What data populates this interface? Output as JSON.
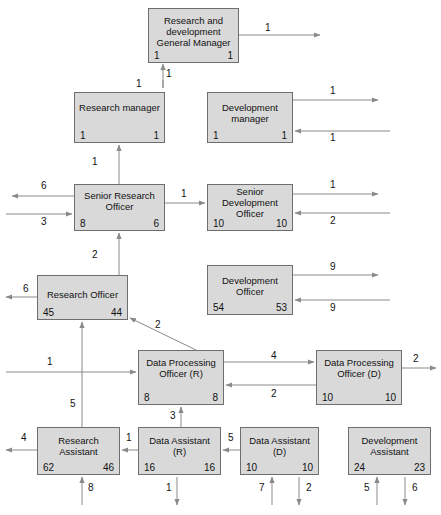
{
  "diagram": {
    "type": "organization-flow-diagram",
    "node_fill": "#d9d9d9",
    "node_stroke": "#6e6e6e",
    "line_color": "#8a8a8a",
    "nodes": [
      {
        "id": "gm",
        "title": "Research and development General Manager",
        "left_count": "1",
        "right_count": "1",
        "x": 148,
        "y": 8,
        "w": 91,
        "h": 55
      },
      {
        "id": "rm",
        "title": "Research manager",
        "left_count": "1",
        "right_count": "1",
        "x": 74,
        "y": 92,
        "w": 91,
        "h": 51
      },
      {
        "id": "dm",
        "title": "Development manager",
        "left_count": "1",
        "right_count": "1",
        "x": 207,
        "y": 92,
        "w": 86,
        "h": 51
      },
      {
        "id": "sro",
        "title": "Senior Research Officer",
        "left_count": "8",
        "right_count": "6",
        "x": 74,
        "y": 184,
        "w": 91,
        "h": 47
      },
      {
        "id": "sdo",
        "title": "Senior Development Officer",
        "left_count": "10",
        "right_count": "10",
        "x": 207,
        "y": 184,
        "w": 86,
        "h": 47
      },
      {
        "id": "ro",
        "title": "Research Officer",
        "left_count": "45",
        "right_count": "44",
        "x": 37,
        "y": 275,
        "w": 91,
        "h": 45
      },
      {
        "id": "do",
        "title": "Development Officer",
        "left_count": "54",
        "right_count": "53",
        "x": 207,
        "y": 265,
        "w": 86,
        "h": 50
      },
      {
        "id": "dpor",
        "title": "Data Processing Officer (R)",
        "left_count": "8",
        "right_count": "8",
        "x": 138,
        "y": 350,
        "w": 86,
        "h": 55
      },
      {
        "id": "dpod",
        "title": "Data Processing Officer (D)",
        "left_count": "10",
        "right_count": "10",
        "x": 316,
        "y": 350,
        "w": 86,
        "h": 55
      },
      {
        "id": "ra",
        "title": "Research Assistant",
        "left_count": "62",
        "right_count": "46",
        "x": 37,
        "y": 427,
        "w": 83,
        "h": 48
      },
      {
        "id": "dar",
        "title": "Data Assistant (R)",
        "left_count": "16",
        "right_count": "16",
        "x": 138,
        "y": 427,
        "w": 83,
        "h": 48
      },
      {
        "id": "dad",
        "title": "Data Assistant (D)",
        "left_count": "10",
        "right_count": "10",
        "x": 240,
        "y": 427,
        "w": 79,
        "h": 48
      },
      {
        "id": "da",
        "title": "Development Assistant",
        "left_count": "24",
        "right_count": "23",
        "x": 348,
        "y": 427,
        "w": 83,
        "h": 48
      }
    ],
    "edge_labels": [
      {
        "id": "gm-out",
        "text": "1",
        "x": 265,
        "y": 22
      },
      {
        "id": "gm-in-bottom",
        "text": "1",
        "x": 166,
        "y": 68
      },
      {
        "id": "rm-up",
        "text": "1",
        "x": 136,
        "y": 78
      },
      {
        "id": "dm-out",
        "text": "1",
        "x": 330,
        "y": 93
      },
      {
        "id": "dm-in",
        "text": "1",
        "x": 330,
        "y": 128
      },
      {
        "id": "sro-up",
        "text": "1",
        "x": 92,
        "y": 158
      },
      {
        "id": "sro-out-left",
        "text": "6",
        "x": 41,
        "y": 182
      },
      {
        "id": "sro-in-left",
        "text": "3",
        "x": 41,
        "y": 217
      },
      {
        "id": "sro-to-sdo",
        "text": "1",
        "x": 181,
        "y": 189
      },
      {
        "id": "sdo-out-right",
        "text": "1",
        "x": 330,
        "y": 182
      },
      {
        "id": "sdo-in-right",
        "text": "2",
        "x": 330,
        "y": 217
      },
      {
        "id": "ro-up",
        "text": "2",
        "x": 92,
        "y": 251
      },
      {
        "id": "ro-out-left",
        "text": "6",
        "x": 23,
        "y": 285
      },
      {
        "id": "do-out-right",
        "text": "9",
        "x": 330,
        "y": 266
      },
      {
        "id": "do-in-right",
        "text": "9",
        "x": 330,
        "y": 303
      },
      {
        "id": "dpor-diag",
        "text": "2",
        "x": 155,
        "y": 321
      },
      {
        "id": "dpor-in-left",
        "text": "1",
        "x": 47,
        "y": 358
      },
      {
        "id": "dpor-to-dpod",
        "text": "4",
        "x": 271,
        "y": 355
      },
      {
        "id": "dpod-to-dpor",
        "text": "2",
        "x": 271,
        "y": 389
      },
      {
        "id": "dpod-out",
        "text": "2",
        "x": 413,
        "y": 355
      },
      {
        "id": "dpor-up",
        "text": "3",
        "x": 172,
        "y": 412
      },
      {
        "id": "ra-up",
        "text": "5",
        "x": 71,
        "y": 400
      },
      {
        "id": "ra-out-left",
        "text": "4",
        "x": 21,
        "y": 434
      },
      {
        "id": "dar-to-ra",
        "text": "1",
        "x": 127,
        "y": 434
      },
      {
        "id": "dad-to-dar",
        "text": "5",
        "x": 229,
        "y": 434
      },
      {
        "id": "ra-in-bottom",
        "text": "8",
        "x": 88,
        "y": 484
      },
      {
        "id": "dar-out-bottom",
        "text": "1",
        "x": 168,
        "y": 484
      },
      {
        "id": "dad-in-bottom",
        "text": "7",
        "x": 259,
        "y": 484
      },
      {
        "id": "dad-out-bottom",
        "text": "2",
        "x": 306,
        "y": 484
      },
      {
        "id": "da-in-bottom",
        "text": "5",
        "x": 364,
        "y": 484
      },
      {
        "id": "da-out-bottom",
        "text": "6",
        "x": 412,
        "y": 484
      }
    ]
  }
}
